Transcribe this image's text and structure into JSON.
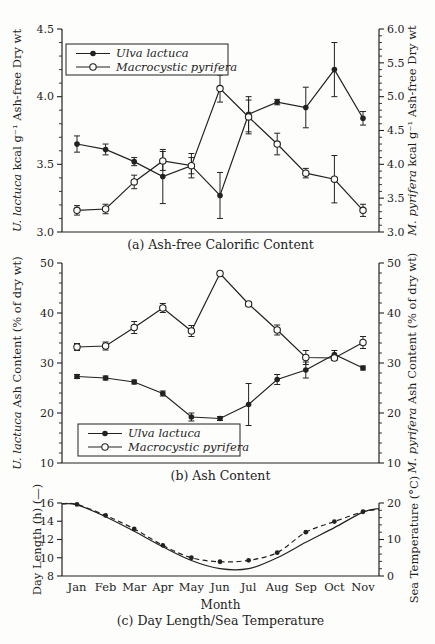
{
  "page": {
    "background": "#fdfdfb",
    "line_color": "#222222"
  },
  "chart_data": [
    {
      "id": "a",
      "type": "line",
      "caption": "(a) Ash-free Calorific Content",
      "categories": [
        "Jan",
        "Feb",
        "Mar",
        "Apr",
        "May",
        "Jun",
        "Jul",
        "Aug",
        "Sep",
        "Oct",
        "Nov"
      ],
      "left_axis": {
        "label_parts": [
          {
            "text": "U. lactuca",
            "italic": true
          },
          {
            "text": " kcal g⁻¹ Ash-free Dry wt",
            "italic": false
          }
        ],
        "range": [
          3.0,
          4.5
        ],
        "major_ticks": [
          3.0,
          3.5,
          4.0,
          4.5
        ],
        "minor_step": 0.1,
        "tick_decimals": 1
      },
      "right_axis": {
        "label_parts": [
          {
            "text": "M. pyrifera",
            "italic": true
          },
          {
            "text": " kcal g⁻¹ Ash-free Dry wt",
            "italic": false
          }
        ],
        "range": [
          3.0,
          6.0
        ],
        "major_ticks": [
          3.0,
          3.5,
          4.0,
          4.5,
          5.0,
          5.5,
          6.0
        ],
        "minor_step": 0.1,
        "tick_decimals": 1
      },
      "legend": {
        "position": "top-left",
        "items": [
          {
            "label": "Ulva lactuca",
            "marker": "filled-circle"
          },
          {
            "label": "Macrocystic pyrifera",
            "marker": "open-circle"
          }
        ]
      },
      "series": [
        {
          "name": "Ulva lactuca",
          "axis": "left",
          "marker": "filled-circle",
          "line": "solid",
          "values": [
            3.65,
            3.61,
            3.52,
            3.41,
            3.49,
            3.27,
            3.87,
            3.96,
            3.92,
            4.2,
            3.84
          ],
          "errors": [
            0.06,
            0.04,
            0.03,
            0.2,
            0.09,
            0.17,
            0.13,
            0.02,
            0.15,
            0.2,
            0.05
          ]
        },
        {
          "name": "Macrocystic pyrifera",
          "axis": "right",
          "marker": "open-circle",
          "line": "solid",
          "values": [
            3.32,
            3.34,
            3.74,
            4.05,
            3.98,
            5.12,
            4.7,
            4.3,
            3.87,
            3.78,
            3.32
          ],
          "errors": [
            0.07,
            0.07,
            0.1,
            0.14,
            0.12,
            0.2,
            0.25,
            0.16,
            0.07,
            0.35,
            0.09
          ]
        }
      ]
    },
    {
      "id": "b",
      "type": "line",
      "caption": "(b) Ash Content",
      "categories": [
        "Jan",
        "Feb",
        "Mar",
        "Apr",
        "May",
        "Jun",
        "Jul",
        "Aug",
        "Sep",
        "Oct",
        "Nov"
      ],
      "left_axis": {
        "label_parts": [
          {
            "text": "U. lactuca",
            "italic": true
          },
          {
            "text": " Ash Content (% of dry wt)",
            "italic": false
          }
        ],
        "range": [
          10,
          50
        ],
        "major_ticks": [
          10,
          20,
          30,
          40,
          50
        ],
        "minor_step": 2,
        "tick_decimals": 0
      },
      "right_axis": {
        "label_parts": [
          {
            "text": "M. pyrifera",
            "italic": true
          },
          {
            "text": " Ash Content (% of dry wt)",
            "italic": false
          }
        ],
        "range": [
          10,
          50
        ],
        "major_ticks": [
          10,
          20,
          30,
          40,
          50
        ],
        "minor_step": 2,
        "tick_decimals": 0
      },
      "legend": {
        "position": "bottom-left",
        "items": [
          {
            "label": "Ulva lactuca",
            "marker": "filled-circle"
          },
          {
            "label": "Macrocystic pyrifera",
            "marker": "open-circle"
          }
        ]
      },
      "series": [
        {
          "name": "Ulva lactuca",
          "axis": "left",
          "marker": "filled-circle",
          "line": "solid",
          "values": [
            27.3,
            27.0,
            26.2,
            23.9,
            19.2,
            18.9,
            21.7,
            26.7,
            28.6,
            31.7,
            29.0
          ],
          "errors": [
            0.4,
            0.4,
            0.4,
            0.5,
            0.8,
            0.4,
            4.2,
            1.0,
            1.6,
            0.8,
            0.4
          ]
        },
        {
          "name": "Macrocystic pyrifera",
          "axis": "right",
          "marker": "open-circle",
          "line": "solid",
          "values": [
            33.2,
            33.4,
            37.1,
            41.0,
            36.4,
            47.9,
            41.8,
            36.6,
            31.1,
            31.0,
            34.1
          ],
          "errors": [
            0.7,
            0.8,
            1.2,
            0.9,
            1.1,
            0.4,
            0.4,
            1.0,
            1.4,
            0.5,
            1.2
          ]
        }
      ]
    },
    {
      "id": "c",
      "type": "line",
      "caption": "(c) Day Length/Sea Temperature",
      "xlabel": "Month",
      "show_x_labels": true,
      "categories": [
        "Jan",
        "Feb",
        "Mar",
        "Apr",
        "May",
        "Jun",
        "Jul",
        "Aug",
        "Sep",
        "Oct",
        "Nov"
      ],
      "left_axis": {
        "label_parts": [
          {
            "text": "Day Length (h) (—)",
            "italic": false
          }
        ],
        "range": [
          8,
          16
        ],
        "major_ticks": [
          8,
          10,
          12,
          14,
          16
        ],
        "minor_step": 0,
        "tick_decimals": 0
      },
      "right_axis": {
        "label_parts": [
          {
            "text": "Sea Temperature (°C)",
            "italic": false
          }
        ],
        "range": [
          0,
          20
        ],
        "major_ticks": [
          0,
          10,
          20
        ],
        "minor_step": 2,
        "tick_decimals": 0
      },
      "series": [
        {
          "name": "Day length",
          "axis": "left",
          "marker": "none",
          "line": "solid",
          "smooth": true,
          "values": [
            15.8,
            14.5,
            12.9,
            11.2,
            9.7,
            8.8,
            8.8,
            10.0,
            11.7,
            13.3,
            15.0
          ],
          "edge_values": [
            15.9,
            15.4
          ]
        },
        {
          "name": "Sea temperature",
          "axis": "right",
          "marker": "filled-circle-small",
          "line": "dashed",
          "smooth": true,
          "values": [
            19.6,
            16.6,
            12.9,
            8.4,
            5.0,
            3.9,
            4.3,
            6.4,
            12.0,
            14.9,
            17.6
          ],
          "edge_values": [
            19.8,
            18.2
          ]
        }
      ]
    }
  ]
}
